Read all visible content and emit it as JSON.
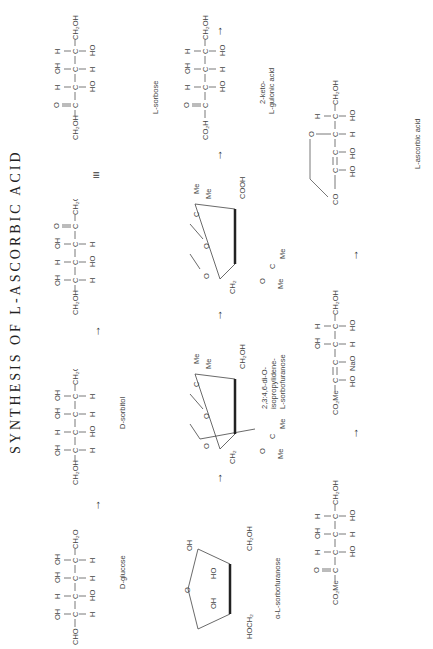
{
  "title": "SYNTHESIS OF L-ASCORBIC ACID",
  "arrows": {
    "symbol": "→"
  },
  "equiv": "≡",
  "compounds": {
    "d_glucose": {
      "name": "D-glucose",
      "top": "CHO",
      "rows": [
        [
          "H",
          "OH"
        ],
        [
          "HO",
          "H"
        ],
        [
          "H",
          "OH"
        ],
        [
          "H",
          "OH"
        ]
      ],
      "bottom": "CH₂OH"
    },
    "d_sorbitol": {
      "name": "D-sorbitol",
      "top": "CH₂OH",
      "rows": [
        [
          "H",
          "OH"
        ],
        [
          "HO",
          "H"
        ],
        [
          "H",
          "OH"
        ],
        [
          "H",
          "OH"
        ]
      ],
      "bottom": "CH₂OH"
    },
    "l_sorbose_open": {
      "top": "CH₂OH",
      "rows": [
        [
          "H",
          "OH"
        ],
        [
          "HO",
          "H"
        ],
        [
          "H",
          "OH"
        ]
      ],
      "keto": "C═O",
      "bottom": "CH₂OH"
    },
    "l_sorbose": {
      "name": "L-sorbose",
      "top": "CH₂OH",
      "keto": "C═O",
      "rows": [
        [
          "HO",
          "H"
        ],
        [
          "H",
          "OH"
        ],
        [
          "HO",
          "H"
        ]
      ],
      "bottom": "CH₂OH"
    },
    "alpha_l_sorbofuranose": {
      "name": "α-L-sorbofuranose",
      "labels": [
        "OH",
        "CH₂OH",
        "HO",
        "OH",
        "HOCH₂",
        "O"
      ]
    },
    "diacetone_sorbose": {
      "name_lines": [
        "2,3:4,6-di-O-",
        "isopropylidene-",
        "L-sorbofuranose"
      ],
      "labels": [
        "Me",
        "Me",
        "C",
        "O",
        "O",
        "O",
        "CH₂OH",
        "CH₂",
        "O",
        "O",
        "C",
        "Me",
        "Me"
      ]
    },
    "diacetone_ketogulonic": {
      "labels": [
        "Me",
        "Me",
        "C",
        "O",
        "O",
        "O",
        "COOH",
        "CH₂",
        "O",
        "O",
        "C",
        "Me",
        "Me"
      ]
    },
    "keto_gulonic_acid": {
      "name_lines": [
        "2-keto-",
        "L-gulonic acid"
      ],
      "top": "CO₂H",
      "keto": "C═O",
      "rows": [
        [
          "HO",
          "H"
        ],
        [
          "H",
          "OH"
        ],
        [
          "HO",
          "H"
        ]
      ],
      "bottom": "CH₂OH"
    },
    "methyl_ester": {
      "top": "CO₂Me",
      "keto": "C═O",
      "rows": [
        [
          "HO",
          "H"
        ],
        [
          "H",
          "OH"
        ],
        [
          "HO",
          "H"
        ]
      ],
      "bottom": "CH₂OH"
    },
    "enolate": {
      "top": "CO₂Me",
      "rows": [
        [
          "HO",
          ""
        ],
        [
          "NaO",
          ""
        ],
        [
          "H",
          "OH"
        ],
        [
          "HO",
          "H"
        ]
      ],
      "bottom": "CH₂OH"
    },
    "l_ascorbic_acid": {
      "name": "L-ascorbic acid",
      "top": "CO",
      "rows": [
        [
          "HO",
          ""
        ],
        [
          "HO",
          ""
        ],
        [
          "H",
          "O"
        ],
        [
          "HO",
          "H"
        ]
      ],
      "bottom": "CH₂OH"
    }
  }
}
